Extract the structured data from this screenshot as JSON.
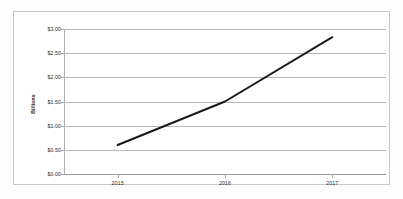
{
  "chart_data": {
    "type": "line",
    "title": "",
    "subtitle": "",
    "xlabel": "",
    "ylabel": "Billions",
    "categories": [
      "2015",
      "2016",
      "2017"
    ],
    "x": [
      2015,
      2016,
      2017
    ],
    "series": [
      {
        "name": "Revenue",
        "values": [
          0.6,
          1.5,
          2.83
        ],
        "color": "#1a1a1a"
      }
    ],
    "ylim": [
      0.0,
      3.0
    ],
    "y_ticks": [
      0.0,
      0.5,
      1.0,
      1.5,
      2.0,
      2.5,
      3.0
    ],
    "y_tick_labels": [
      "$0.00",
      "$0.50",
      "$1.00",
      "$1.50",
      "$2.00",
      "$2.50",
      "$3.00"
    ],
    "x_tick_labels": [
      "2015",
      "2016",
      "2017"
    ],
    "grid": true,
    "grid_axis": "y",
    "legend": false,
    "legend_position": "none",
    "markers": false,
    "annotations": []
  },
  "style": {
    "line_color": "#1a1a1a",
    "gridline_color": "#b9b9b9",
    "frame_color": "#c8c8c8",
    "text_color": "#2b2b2b",
    "background": "#ffffff"
  }
}
